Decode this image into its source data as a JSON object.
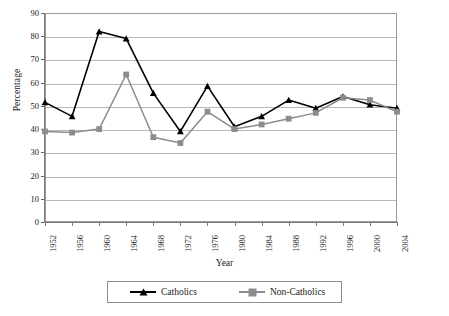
{
  "chart_data": {
    "type": "line",
    "title": "",
    "xlabel": "Year",
    "ylabel": "Percentage",
    "categories": [
      "1952",
      "1956",
      "1960",
      "1964",
      "1968",
      "1972",
      "1976",
      "1980",
      "1984",
      "1988",
      "1992",
      "1996",
      "2000",
      "2004"
    ],
    "x": [
      1952,
      1956,
      1960,
      1964,
      1968,
      1972,
      1976,
      1980,
      1984,
      1988,
      1992,
      1996,
      2000,
      2004
    ],
    "ylim": [
      0,
      90
    ],
    "xlim": [
      "1952",
      "2004"
    ],
    "yticks": [
      0,
      10,
      20,
      30,
      40,
      50,
      60,
      70,
      80,
      90
    ],
    "grid": "horizontal",
    "legend_position": "bottom",
    "series": [
      {
        "name": "Catholics",
        "color": "#000000",
        "marker": "triangle",
        "values": [
          51.5,
          45.5,
          82.0,
          79.0,
          55.5,
          39.0,
          58.5,
          41.0,
          45.5,
          52.5,
          49.0,
          54.0,
          50.5,
          49.0
        ]
      },
      {
        "name": "Non-Catholics",
        "color": "#8c8c8c",
        "marker": "square",
        "values": [
          39.0,
          38.5,
          40.0,
          63.5,
          36.5,
          34.0,
          47.5,
          40.0,
          42.0,
          44.5,
          47.0,
          53.5,
          52.5,
          47.5
        ]
      }
    ]
  },
  "axes": {
    "y_title": "Percentage",
    "x_title": "Year",
    "y_tick_labels": [
      "0",
      "10",
      "20",
      "30",
      "40",
      "50",
      "60",
      "70",
      "80",
      "90"
    ],
    "x_tick_labels": [
      "1952",
      "1956",
      "1960",
      "1964",
      "1968",
      "1972",
      "1976",
      "1980",
      "1984",
      "1988",
      "1992",
      "1996",
      "2000",
      "2004"
    ]
  },
  "legend": {
    "items": [
      {
        "label": "Catholics",
        "color": "#000000",
        "marker": "triangle"
      },
      {
        "label": "Non-Catholics",
        "color": "#8c8c8c",
        "marker": "square"
      }
    ]
  },
  "colors": {
    "catholics": "#000000",
    "non_catholics": "#8c8c8c",
    "grid": "#b8b8b8",
    "frame": "#9a9a9a",
    "background": "#ffffff"
  }
}
